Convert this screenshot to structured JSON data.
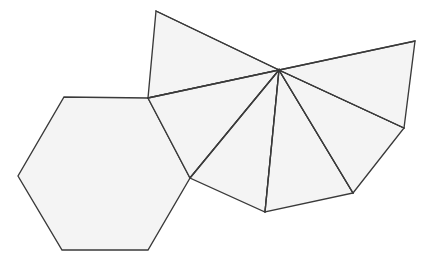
{
  "figure": {
    "canvas": {
      "width": 426,
      "height": 268
    },
    "style": {
      "background_color": "#ffffff",
      "face_fill_color": "#f4f4f4",
      "stroke_color": "#3a3a3a",
      "stroke_width": 1.35
    },
    "hub_label": "central-fan-vertex",
    "hub_point": "279,70",
    "shapes": [
      {
        "name": "hexagon",
        "kind": "hexagon",
        "sides": 6,
        "points": "64,97 148,98 190,178 148,250 62,250 18,176"
      },
      {
        "name": "upper-left-triangle",
        "kind": "triangle",
        "sides": 3,
        "points": "156,11 279,70 148,98"
      },
      {
        "name": "fan-triangle-1",
        "kind": "triangle",
        "sides": 3,
        "points": "148,98 279,70 190,178"
      },
      {
        "name": "fan-triangle-2",
        "kind": "triangle",
        "sides": 3,
        "points": "190,178 279,70 265,212"
      },
      {
        "name": "fan-triangle-3",
        "kind": "triangle",
        "sides": 3,
        "points": "265,212 279,70 353,193"
      },
      {
        "name": "fan-triangle-4",
        "kind": "triangle",
        "sides": 3,
        "points": "353,193 279,70 404,128"
      },
      {
        "name": "upper-right-triangle",
        "kind": "triangle",
        "sides": 3,
        "points": "404,128 279,70 415,41"
      }
    ],
    "spokes": [
      {
        "name": "spoke-to-upper-left-apex",
        "d": "M279,70 L156,11"
      },
      {
        "name": "spoke-to-hexagon-top-right",
        "d": "M279,70 L148,98"
      },
      {
        "name": "spoke-to-hexagon-right",
        "d": "M279,70 L190,178"
      },
      {
        "name": "spoke-to-lower-left",
        "d": "M279,70 L265,212"
      },
      {
        "name": "spoke-to-lower-right",
        "d": "M279,70 L353,193"
      },
      {
        "name": "spoke-to-right",
        "d": "M279,70 L404,128"
      },
      {
        "name": "spoke-to-upper-right-apex",
        "d": "M279,70 L415,41"
      }
    ]
  }
}
